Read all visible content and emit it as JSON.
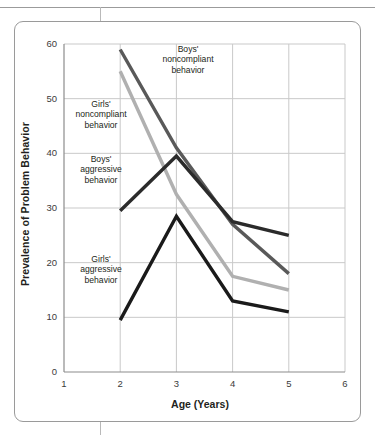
{
  "figure": {
    "y_axis_title": "Prevalence of Problem Behavior",
    "x_axis_title": "Age (Years)"
  },
  "annotations": {
    "boys_noncompliant": "Boys'\nnoncompliant\nbehavior",
    "girls_noncompliant": "Girls'\nnoncompliant\nbehavior",
    "boys_aggressive": "Boys'\naggressive\nbehavior",
    "girls_aggressive": "Girls'\naggressive\nbehavior"
  },
  "colors": {
    "boys_noncompliant": "#595959",
    "girls_noncompliant": "#b0b0b0",
    "boys_aggressive": "#2b2b2b",
    "girls_aggressive": "#1a1a1a",
    "gridline": "#c9c9c9",
    "axis": "#8c8c8c",
    "frame": "#9a9a9a",
    "background": "#ffffff"
  },
  "chart_data": {
    "type": "line",
    "title": "",
    "xlabel": "Age (Years)",
    "ylabel": "Prevalence of Problem Behavior",
    "xlim": [
      1,
      6
    ],
    "ylim": [
      0,
      60
    ],
    "xticks": [
      1,
      2,
      3,
      4,
      5,
      6
    ],
    "yticks": [
      0,
      10,
      20,
      30,
      40,
      50,
      60
    ],
    "x": [
      2,
      3,
      4,
      5
    ],
    "grid": true,
    "legend": "in-plot annotations",
    "series": [
      {
        "name": "Boys' noncompliant behavior",
        "color": "#595959",
        "values": [
          59,
          41,
          27,
          18
        ]
      },
      {
        "name": "Girls' noncompliant behavior",
        "color": "#b0b0b0",
        "values": [
          55,
          32.5,
          17.5,
          15
        ]
      },
      {
        "name": "Boys' aggressive behavior",
        "color": "#2b2b2b",
        "values": [
          29.5,
          39.5,
          27.5,
          25
        ]
      },
      {
        "name": "Girls' aggressive behavior",
        "color": "#1a1a1a",
        "values": [
          9.5,
          28.5,
          13,
          11
        ]
      }
    ]
  }
}
